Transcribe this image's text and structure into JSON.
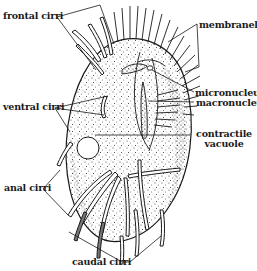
{
  "figure": {
    "ink_color": "#1a1a1a",
    "background_color": "#ffffff",
    "body_fill": "#ffffff",
    "labels": [
      {
        "id": "frontal-cirri",
        "text": "frontal cirri"
      },
      {
        "id": "membranelles",
        "text": "membranelles"
      },
      {
        "id": "micronucleus",
        "text": "micronucleus"
      },
      {
        "id": "macronucleus",
        "text": "macronucleus"
      },
      {
        "id": "ventral-cirri",
        "text": "ventral cirri"
      },
      {
        "id": "contractile-vacuole",
        "line1": "contractile",
        "line2": "vacuole"
      },
      {
        "id": "anal-cirri",
        "text": "anal cirri"
      },
      {
        "id": "caudal-cirri",
        "text": "caudal cirri"
      }
    ]
  }
}
